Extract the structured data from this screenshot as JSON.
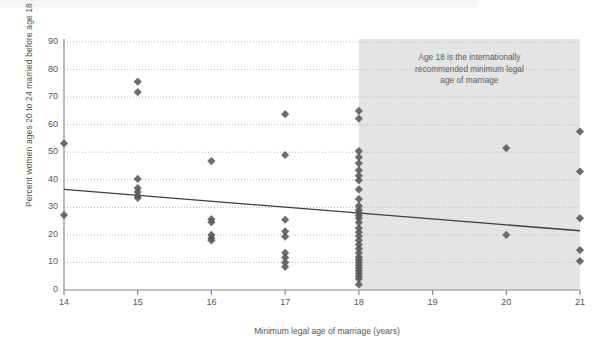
{
  "chart_data": {
    "type": "scatter",
    "title": "",
    "xlabel": "Minimum legal age of marriage (years)",
    "ylabel": "Percent women ages 20 to 24 married before age 18",
    "xlim": [
      14,
      21
    ],
    "ylim": [
      0,
      90
    ],
    "xticks": [
      "14",
      "15",
      "16",
      "17",
      "18",
      "19",
      "20",
      "21"
    ],
    "yticks": [
      "0",
      "10",
      "20",
      "30",
      "40",
      "50",
      "60",
      "70",
      "80",
      "90"
    ],
    "grid": "horizontal-dotted",
    "legend": "none",
    "marker": "diamond",
    "marker_color": "#595959",
    "shaded_region": {
      "from": 18,
      "to": 21,
      "color": "#e4e4e4",
      "label": "Age 18 is the internationally recommended minimum legal age of marriage"
    },
    "annotation_lines": [
      "Age 18 is the internationally",
      "recommended minimum legal",
      "age of marriage"
    ],
    "trendline": {
      "type": "linear",
      "color": "#3d3d3d",
      "x_start": 14,
      "y_start": 36.5,
      "x_end": 21,
      "y_end": 21.5
    },
    "points": [
      {
        "x": 14,
        "y": 53.2
      },
      {
        "x": 14,
        "y": 27.2
      },
      {
        "x": 15,
        "y": 75.6
      },
      {
        "x": 15,
        "y": 71.8
      },
      {
        "x": 15,
        "y": 40.3
      },
      {
        "x": 15,
        "y": 37.0
      },
      {
        "x": 15,
        "y": 35.6
      },
      {
        "x": 15,
        "y": 34.2
      },
      {
        "x": 15,
        "y": 33.4
      },
      {
        "x": 16,
        "y": 46.8
      },
      {
        "x": 16,
        "y": 25.7
      },
      {
        "x": 16,
        "y": 24.6
      },
      {
        "x": 16,
        "y": 20.0
      },
      {
        "x": 16,
        "y": 18.8
      },
      {
        "x": 16,
        "y": 18.0
      },
      {
        "x": 17,
        "y": 63.8
      },
      {
        "x": 17,
        "y": 49.0
      },
      {
        "x": 17,
        "y": 25.5
      },
      {
        "x": 17,
        "y": 21.3
      },
      {
        "x": 17,
        "y": 19.4
      },
      {
        "x": 17,
        "y": 13.5
      },
      {
        "x": 17,
        "y": 11.8
      },
      {
        "x": 17,
        "y": 10.0
      },
      {
        "x": 17,
        "y": 8.4
      },
      {
        "x": 18,
        "y": 65.0
      },
      {
        "x": 18,
        "y": 62.2
      },
      {
        "x": 18,
        "y": 50.4
      },
      {
        "x": 18,
        "y": 48.2
      },
      {
        "x": 18,
        "y": 46.0
      },
      {
        "x": 18,
        "y": 43.5
      },
      {
        "x": 18,
        "y": 41.5
      },
      {
        "x": 18,
        "y": 39.8
      },
      {
        "x": 18,
        "y": 36.5
      },
      {
        "x": 18,
        "y": 33.0
      },
      {
        "x": 18,
        "y": 30.5
      },
      {
        "x": 18,
        "y": 29.0
      },
      {
        "x": 18,
        "y": 28.0
      },
      {
        "x": 18,
        "y": 27.0
      },
      {
        "x": 18,
        "y": 26.0
      },
      {
        "x": 18,
        "y": 24.5
      },
      {
        "x": 18,
        "y": 22.5
      },
      {
        "x": 18,
        "y": 21.0
      },
      {
        "x": 18,
        "y": 19.5
      },
      {
        "x": 18,
        "y": 18.0
      },
      {
        "x": 18,
        "y": 16.5
      },
      {
        "x": 18,
        "y": 15.0
      },
      {
        "x": 18,
        "y": 13.5
      },
      {
        "x": 18,
        "y": 12.0
      },
      {
        "x": 18,
        "y": 11.0
      },
      {
        "x": 18,
        "y": 10.0
      },
      {
        "x": 18,
        "y": 9.0
      },
      {
        "x": 18,
        "y": 8.0
      },
      {
        "x": 18,
        "y": 7.0
      },
      {
        "x": 18,
        "y": 6.0
      },
      {
        "x": 18,
        "y": 5.0
      },
      {
        "x": 18,
        "y": 4.0
      },
      {
        "x": 18,
        "y": 2.0
      },
      {
        "x": 20,
        "y": 51.5
      },
      {
        "x": 20,
        "y": 20.0
      },
      {
        "x": 21,
        "y": 57.5
      },
      {
        "x": 21,
        "y": 43.0
      },
      {
        "x": 21,
        "y": 26.0
      },
      {
        "x": 21,
        "y": 14.5
      },
      {
        "x": 21,
        "y": 10.5
      }
    ]
  }
}
